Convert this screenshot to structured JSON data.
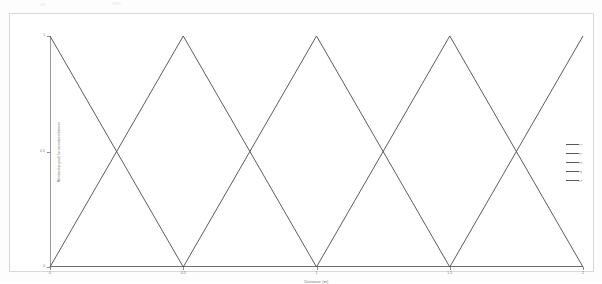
{
  "figure": {
    "x_axis_title": "Distance (m)",
    "y_axis_title": "Membership grade for normalized distance",
    "legend_title": ""
  },
  "chart_data": {
    "type": "line",
    "title": "",
    "xlabel": "Distance (m)",
    "ylabel": "Membership grade for normalized distance",
    "xlim": [
      0,
      2
    ],
    "ylim": [
      0,
      1
    ],
    "xticks": [
      "0",
      "0.5",
      "1",
      "1.5",
      "2"
    ],
    "xtick_values": [
      0,
      0.5,
      1,
      1.5,
      2
    ],
    "yticks": [
      "0",
      "0.5",
      "1"
    ],
    "ytick_values": [
      0,
      0.5,
      1
    ],
    "grid": false,
    "legend_position": "right-outside",
    "line_color": "#4a4a4a",
    "series": [
      {
        "name": "1",
        "x": [
          0,
          0.5
        ],
        "values": [
          1,
          0
        ]
      },
      {
        "name": "2",
        "x": [
          0,
          0.5,
          1
        ],
        "values": [
          0,
          1,
          0
        ]
      },
      {
        "name": "3",
        "x": [
          0.5,
          1,
          1.5
        ],
        "values": [
          0,
          1,
          0
        ]
      },
      {
        "name": "4",
        "x": [
          1,
          1.5,
          2
        ],
        "values": [
          0,
          1,
          0
        ]
      },
      {
        "name": "5",
        "x": [
          1.5,
          2
        ],
        "values": [
          0,
          1
        ]
      }
    ]
  },
  "legend": {
    "entries": [
      {
        "label": "1"
      },
      {
        "label": "2"
      },
      {
        "label": "3"
      },
      {
        "label": "4"
      },
      {
        "label": "5"
      }
    ]
  }
}
